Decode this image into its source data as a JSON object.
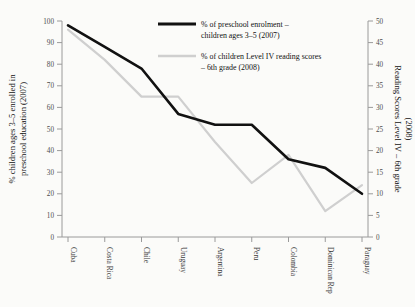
{
  "chart_data": {
    "type": "line",
    "title": "",
    "categories": [
      "Cuba",
      "Costa Rica",
      "Chile",
      "Uruguay",
      "Argentina",
      "Peru",
      "Colombia",
      "Dominican Rep",
      "Paraguay"
    ],
    "series": [
      {
        "name": "% of preschool enrolment – children ages 3–5 (2007)",
        "axis": "left",
        "color": "#111111",
        "values": [
          98,
          88,
          78,
          57,
          52,
          52,
          36,
          32,
          20
        ]
      },
      {
        "name": "% of children Level IV reading scores – 6th grade (2008)",
        "axis": "right",
        "color": "#cfcfcf",
        "values": [
          48,
          41,
          32.5,
          32.5,
          22,
          12.5,
          19,
          6,
          12
        ]
      }
    ],
    "xlabel": "",
    "ylabel": "% children ages 3–5 enrolled in preschool education (2007)",
    "y2label": "Reading Scores Level IV – 6th grade (2008)",
    "ylim": [
      0,
      100
    ],
    "y2lim": [
      0,
      50
    ],
    "yticks": [
      0,
      10,
      20,
      30,
      40,
      50,
      60,
      70,
      80,
      90,
      100
    ],
    "y2ticks": [
      0,
      5,
      10,
      15,
      20,
      25,
      30,
      35,
      40,
      45,
      50
    ],
    "grid": false,
    "legend_position": "top-right"
  },
  "legend": {
    "entries": [
      {
        "line1": "% of preschool enrolment –",
        "line2": "children ages 3–5 (2007)",
        "swatch": "black-line-swatch"
      },
      {
        "line1": "% of children Level IV reading scores",
        "line2": "– 6th grade (2008)",
        "swatch": "gray-line-swatch"
      }
    ]
  },
  "axes": {
    "left_title": "% children ages 3–5 enrolled in preschool education (2007)",
    "right_title": "Reading Scores Level IV – 6th grade (2008)"
  }
}
